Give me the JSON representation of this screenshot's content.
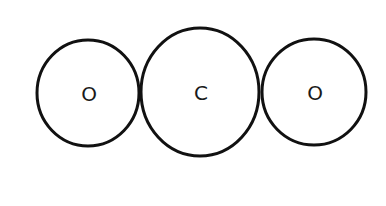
{
  "diagram": {
    "type": "molecule-space-filling",
    "stroke_color": "#111111",
    "background": "#ffffff",
    "atoms": [
      {
        "label": "O",
        "cx": 88,
        "cy": 93,
        "rx": 52,
        "ry": 54
      },
      {
        "label": "C",
        "cx": 200,
        "cy": 92,
        "rx": 59,
        "ry": 65
      },
      {
        "label": "O",
        "cx": 314,
        "cy": 92,
        "rx": 53,
        "ry": 54
      }
    ]
  }
}
